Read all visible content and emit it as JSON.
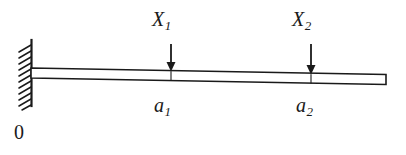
{
  "figure": {
    "kind": "cantilever-beam-free-body-diagram",
    "background_color": "#ffffff",
    "line_color": "#1a1a1a"
  },
  "labels": {
    "load_1": {
      "base": "X",
      "sub": "1"
    },
    "load_2": {
      "base": "X",
      "sub": "2"
    },
    "position_1": {
      "base": "a",
      "sub": "1"
    },
    "position_2": {
      "base": "a",
      "sub": "2"
    },
    "origin": "0"
  },
  "geometry": {
    "wall": {
      "x": 31,
      "y_top": 40,
      "y_bottom": 106,
      "hatch_count": 11
    },
    "beam": {
      "x_left": 31,
      "x_right": 386,
      "y_top_left": 68,
      "y_top_right": 74,
      "thickness": 10
    },
    "arrow_1": {
      "x": 171,
      "y_top": 44,
      "y_tip": 71
    },
    "arrow_2": {
      "x": 311,
      "y_top": 44,
      "y_tip": 74
    },
    "tick_1": {
      "x": 171,
      "y_top": 71,
      "y_bottom": 80
    },
    "tick_2": {
      "x": 311,
      "y_top": 74,
      "y_bottom": 84
    }
  }
}
